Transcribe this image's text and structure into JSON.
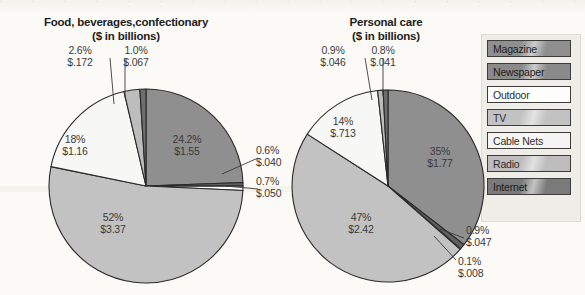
{
  "chart_data": [
    {
      "type": "pie",
      "title": "Food, beverages,confectionary\n($ in billions)",
      "title_line1": "Food, beverages,confectionary",
      "title_line2": "($ in billions)",
      "unit": "$ in billions",
      "categories": [
        "Magazine",
        "Newspaper",
        "Outdoor",
        "TV",
        "Cable Nets",
        "Radio",
        "Internet"
      ],
      "values": [
        1.55,
        0.04,
        0.05,
        3.37,
        1.16,
        0.172,
        0.067
      ],
      "percents": [
        24.2,
        0.6,
        0.7,
        52,
        18,
        2.6,
        1.0
      ],
      "percent_labels": [
        "24.2%",
        "0.6%",
        "0.7%",
        "52%",
        "18%",
        "2.6%",
        "1.0%"
      ],
      "value_labels": [
        "$1.55",
        "$.040",
        "$.050",
        "$3.37",
        "$1.16",
        "$.172",
        "$.067"
      ],
      "legend_position": "right"
    },
    {
      "type": "pie",
      "title": "Personal care\n($ in billions)",
      "title_line1": "Personal care",
      "title_line2": "($ in billions)",
      "unit": "$ in billions",
      "categories": [
        "Magazine",
        "Newspaper",
        "Outdoor",
        "TV",
        "Cable Nets",
        "Radio",
        "Internet"
      ],
      "values": [
        1.77,
        0.047,
        0.008,
        2.42,
        0.713,
        0.046,
        0.041
      ],
      "percents": [
        35,
        0.9,
        0.1,
        47,
        14,
        0.9,
        0.8
      ],
      "percent_labels": [
        "35%",
        "0.9%",
        "0.1%",
        "47%",
        "14%",
        "0.9%",
        "0.8%"
      ],
      "value_labels": [
        "$1.77",
        "$.047",
        "$.008",
        "$2.42",
        "$.713",
        "$.046",
        "$.041"
      ],
      "legend_position": "right"
    }
  ],
  "charts": {
    "left": {
      "title_line1": "Food, beverages,confectionary",
      "title_line2": "($ in billions)",
      "labels": {
        "magazine_pct": "24.2%",
        "magazine_val": "$1.55",
        "tv_pct": "52%",
        "tv_val": "$3.37",
        "cable_pct": "18%",
        "cable_val": "$1.16",
        "radio_pct": "2.6%",
        "radio_val": "$.172",
        "internet_pct": "1.0%",
        "internet_val": "$.067",
        "newspaper_pct": "0.6%",
        "newspaper_val": "$.040",
        "outdoor_pct": "0.7%",
        "outdoor_val": "$.050"
      }
    },
    "right": {
      "title_line1": "Personal care",
      "title_line2": "($ in billions)",
      "labels": {
        "magazine_pct": "35%",
        "magazine_val": "$1.77",
        "tv_pct": "47%",
        "tv_val": "$2.42",
        "cable_pct": "14%",
        "cable_val": "$.713",
        "radio_pct": "0.9%",
        "radio_val": "$.046",
        "internet_pct": "0.8%",
        "internet_val": "$.041",
        "newspaper_pct": "0.9%",
        "newspaper_val": "$.047",
        "outdoor_pct": "0.1%",
        "outdoor_val": "$.008"
      }
    }
  },
  "legend": {
    "items": [
      {
        "label": "Magazine",
        "color": "#8f8f8f"
      },
      {
        "label": "Newspaper",
        "color": "#8a8a8a"
      },
      {
        "label": "Outdoor",
        "color": "#fdfdfb"
      },
      {
        "label": "TV",
        "color": "#c2c2c2"
      },
      {
        "label": "Cable Nets",
        "color": "#f4f4f2"
      },
      {
        "label": "Radio",
        "color": "#bdbdbd"
      },
      {
        "label": "Internet",
        "color": "#7a7a7a"
      }
    ]
  },
  "colors": {
    "magazine": "#8f8f8f",
    "newspaper": "#5f5f5f",
    "outdoor": "#fdfdfb",
    "tv": "#c2c2c2",
    "cable_nets": "#f7f7f5",
    "radio": "#bdbdbd",
    "internet": "#6e6e6e",
    "outline": "#2a2a2a",
    "text": "#3a3a3a",
    "background": "#fbfaf7"
  }
}
